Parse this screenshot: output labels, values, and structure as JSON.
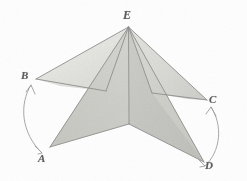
{
  "figure": {
    "background_color": "#fefefe",
    "stroke_color": "#8a8a88",
    "label_color": "#5d5d5d",
    "vertices": [
      {
        "id": "E",
        "label": "E",
        "role": "apex",
        "x": 128,
        "y": 25
      },
      {
        "id": "B",
        "label": "B",
        "role": "left-wing",
        "x": 36,
        "y": 79
      },
      {
        "id": "C",
        "label": "C",
        "role": "right-wing",
        "x": 207,
        "y": 100
      },
      {
        "id": "A",
        "label": "A",
        "role": "lower-left",
        "x": 50,
        "y": 148
      },
      {
        "id": "D",
        "label": "D",
        "role": "lower-right",
        "x": 204,
        "y": 163
      },
      {
        "id": "F",
        "label": "",
        "role": "center-notch",
        "x": 129,
        "y": 124
      }
    ],
    "facets": [
      {
        "name": "upper-left-wing",
        "points": "128,25 36,79 106,90",
        "fill": "#e9e9e6"
      },
      {
        "name": "upper-right-wing",
        "points": "128,25 207,100 150,92",
        "fill": "#dedede"
      },
      {
        "name": "left-inner-blade",
        "points": "128,25 50,148 129,124",
        "fill": "#d8d8d4"
      },
      {
        "name": "right-inner-blade",
        "points": "128,25 204,163 129,124",
        "fill": "#cfcfcb"
      },
      {
        "name": "left-mid-gore",
        "points": "128,25 106,90 50,148",
        "fill": "#e2e2df"
      },
      {
        "name": "right-mid-gore",
        "points": "128,25 150,92 204,163",
        "fill": "#d4d4d0"
      }
    ],
    "edges": [
      {
        "name": "edge-E-B",
        "from": "E",
        "to": "B"
      },
      {
        "name": "edge-E-C",
        "from": "E",
        "to": "C"
      },
      {
        "name": "edge-E-A",
        "from": "E",
        "to": "A"
      },
      {
        "name": "edge-E-D",
        "from": "E",
        "to": "D"
      },
      {
        "name": "edge-E-F",
        "from": "E",
        "to": "F"
      },
      {
        "name": "edge-B-fold",
        "from": "B",
        "to": "fold-left"
      },
      {
        "name": "edge-C-fold",
        "from": "C",
        "to": "fold-right"
      },
      {
        "name": "edge-A-F",
        "from": "A",
        "to": "F"
      },
      {
        "name": "edge-D-F",
        "from": "D",
        "to": "F"
      }
    ],
    "arcs": [
      {
        "name": "arc-B-A",
        "from": "B",
        "to": "A",
        "side": "left",
        "path": "M 31,84 C 19,103 20,132 41,152",
        "arrowheads": 2
      },
      {
        "name": "arc-C-D",
        "from": "C",
        "to": "D",
        "side": "right",
        "path": "M 210,106 C 222,124 221,150 205,166",
        "arrowheads": 2
      }
    ]
  }
}
